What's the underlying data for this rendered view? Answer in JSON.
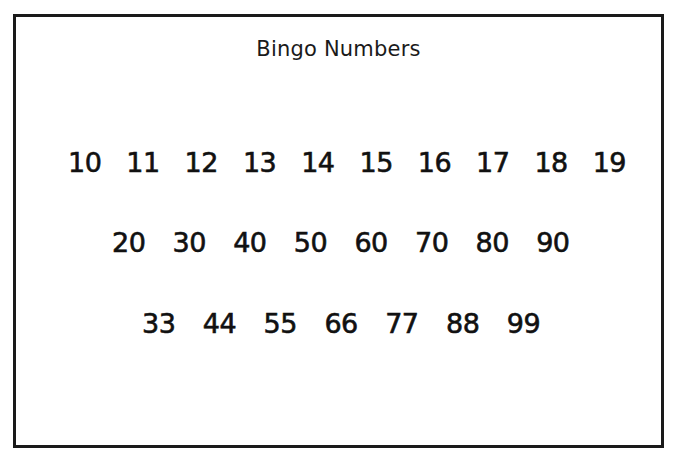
{
  "document": {
    "title": "Bingo Numbers",
    "border_color": "#1a1a1a",
    "text_color": "#111111",
    "background_color": "#ffffff"
  },
  "rows": [
    {
      "numbers": [
        "10",
        "11",
        "12",
        "13",
        "14",
        "15",
        "16",
        "17",
        "18",
        "19"
      ]
    },
    {
      "numbers": [
        "20",
        "30",
        "40",
        "50",
        "60",
        "70",
        "80",
        "90"
      ]
    },
    {
      "numbers": [
        "33",
        "44",
        "55",
        "66",
        "77",
        "88",
        "99"
      ]
    }
  ]
}
